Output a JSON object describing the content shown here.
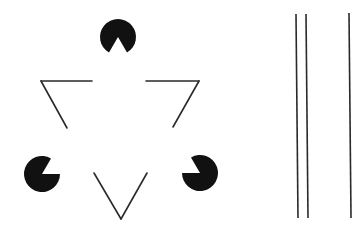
{
  "figure": {
    "background": "#ffffff",
    "ink": "#111111",
    "line_color": "#2a2a2a"
  },
  "pacmen": [
    {
      "id": "top",
      "cx": 118,
      "cy": 37,
      "r": 18,
      "mouth_dir_deg": 90,
      "mouth_width_deg": 60
    },
    {
      "id": "left",
      "cx": 42,
      "cy": 174,
      "r": 18,
      "mouth_dir_deg": -30,
      "mouth_width_deg": 60
    },
    {
      "id": "right",
      "cx": 200,
      "cy": 173,
      "r": 18,
      "mouth_dir_deg": 210,
      "mouth_width_deg": 60
    }
  ],
  "outline_triangle_segments": [
    {
      "id": "top-left-horizontal",
      "x1": 41,
      "y1": 81,
      "x2": 92,
      "y2": 81
    },
    {
      "id": "top-left-diagonal",
      "x1": 41,
      "y1": 81,
      "x2": 67,
      "y2": 128
    },
    {
      "id": "top-right-horizontal",
      "x1": 146,
      "y1": 81,
      "x2": 199,
      "y2": 81
    },
    {
      "id": "top-right-diagonal",
      "x1": 199,
      "y1": 81,
      "x2": 173,
      "y2": 127
    },
    {
      "id": "bottom-left-diagonal",
      "x1": 94,
      "y1": 173,
      "x2": 121,
      "y2": 219
    },
    {
      "id": "bottom-right-diagonal",
      "x1": 121,
      "y1": 219,
      "x2": 147,
      "y2": 173
    }
  ],
  "vertical_lines": [
    {
      "id": "line-1",
      "x1": 296,
      "y1": 14,
      "x2": 298,
      "y2": 218
    },
    {
      "id": "line-2",
      "x1": 306,
      "y1": 14,
      "x2": 308,
      "y2": 218
    },
    {
      "id": "line-3",
      "x1": 349,
      "y1": 13,
      "x2": 351,
      "y2": 218
    }
  ]
}
